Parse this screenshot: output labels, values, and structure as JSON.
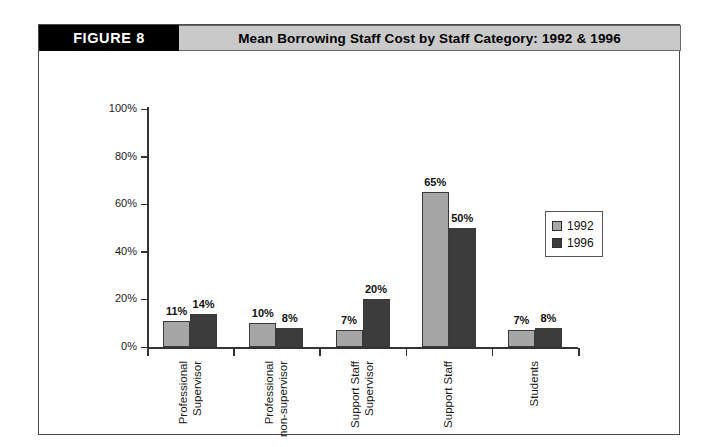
{
  "figure": {
    "badge": "FIGURE 8",
    "title": "Mean Borrowing Staff Cost by Staff Category: 1992 & 1996"
  },
  "legend": {
    "position": "right-middle",
    "entries": [
      {
        "label": "1992",
        "color": "#a6a6a6"
      },
      {
        "label": "1996",
        "color": "#3c3c3c"
      }
    ]
  },
  "axis": {
    "y_ticks": [
      "0%",
      "20%",
      "40%",
      "60%",
      "80%",
      "100%"
    ]
  },
  "chart_data": {
    "type": "bar",
    "title": "Mean Borrowing Staff Cost by Staff Category: 1992 & 1996",
    "xlabel": "",
    "ylabel": "",
    "ylim": [
      0,
      100
    ],
    "ytick_values": [
      0,
      20,
      40,
      60,
      80,
      100
    ],
    "ytick_labels": [
      "0%",
      "20%",
      "40%",
      "60%",
      "80%",
      "100%"
    ],
    "grid": false,
    "legend_position": "right",
    "categories": [
      "Professional Supervisor",
      "Professional non-supervisor",
      "Support Staff Supervisor",
      "Support Staff",
      "Students"
    ],
    "category_lines": [
      [
        "Professional",
        "Supervisor"
      ],
      [
        "Professional",
        "non-supervisor"
      ],
      [
        "Support Staff",
        "Supervisor"
      ],
      [
        "Support Staff"
      ],
      [
        "Students"
      ]
    ],
    "series": [
      {
        "name": "1992",
        "color": "#a6a6a6",
        "values": [
          11,
          10,
          7,
          65,
          7
        ],
        "labels": [
          "11%",
          "10%",
          "7%",
          "65%",
          "7%"
        ]
      },
      {
        "name": "1996",
        "color": "#3c3c3c",
        "values": [
          14,
          8,
          20,
          50,
          8
        ],
        "labels": [
          "14%",
          "8%",
          "20%",
          "50%",
          "8%"
        ]
      }
    ]
  }
}
